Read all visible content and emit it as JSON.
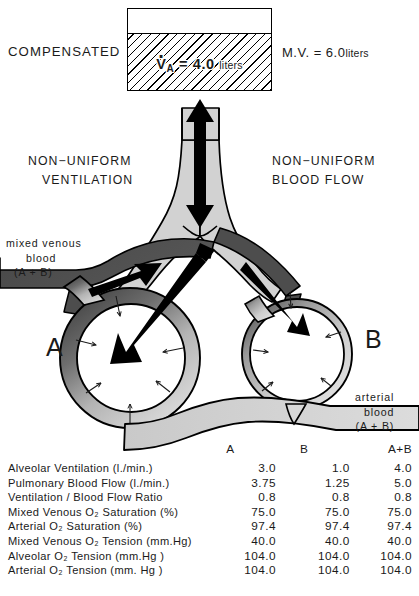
{
  "title_label": "COMPENSATED",
  "ventilation_box": {
    "va_symbol": "V",
    "va_subscript": "A",
    "va_equals": "= 4.0",
    "va_units": "liters"
  },
  "minute_volume": {
    "label": "M.V. =",
    "value": "6.0",
    "units": "liters"
  },
  "captions": {
    "left_line1": "NON−UNIFORM",
    "left_line2": "VENTILATION",
    "right_line1": "NON−UNIFORM",
    "right_line2": "BLOOD   FLOW",
    "mixed_venous_line1": "mixed venous",
    "mixed_venous_line2": "blood",
    "mixed_venous_line3": "(A + B)",
    "arterial_line1": "arterial",
    "arterial_line2": "blood",
    "arterial_line3": "(A + B)"
  },
  "regions": {
    "left_letter": "A",
    "right_letter": "B"
  },
  "table": {
    "headers": [
      "",
      "A",
      "B",
      "A+B"
    ],
    "rows": [
      {
        "label": "Alveolar Ventilation (l./min.)",
        "a": "3.0",
        "b": "1.0",
        "ab": "4.0"
      },
      {
        "label": "Pulmonary  Blood Flow (l./min.)",
        "a": "3.75",
        "b": "1.25",
        "ab": "5.0"
      },
      {
        "label": "Ventilation / Blood Flow Ratio",
        "a": "0.8",
        "b": "0.8",
        "ab": "0.8"
      },
      {
        "label": "Mixed Venous  O₂ Saturation (%)",
        "a": "75.0",
        "b": "75.0",
        "ab": "75.0"
      },
      {
        "label": "Arterial O₂ Saturation (%)",
        "a": "97.4",
        "b": "97.4",
        "ab": "97.4"
      },
      {
        "label": "Mixed Venous O₂ Tension (mm.Hg)",
        "a": "40.0",
        "b": "40.0",
        "ab": "40.0"
      },
      {
        "label": "Alveolar O₂ Tension (mm.Hg )",
        "a": "104.0",
        "b": "104.0",
        "ab": "104.0"
      },
      {
        "label": "Arterial O₂  Tension (mm. Hg )",
        "a": "104.0",
        "b": "104.0",
        "ab": "104.0"
      }
    ]
  },
  "colors": {
    "airway_fill": "#d2d2d2",
    "venous_blood": "#4d4d4d",
    "arterial_blood": "#d8d8d8",
    "outline": "#000000"
  }
}
